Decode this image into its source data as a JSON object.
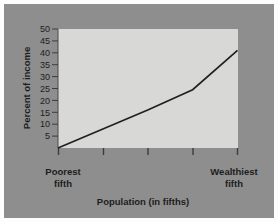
{
  "figure": {
    "background_color": "#8e8e8e",
    "plot_area_color": "#d8d8d6",
    "line_color": "#23211f",
    "text_color": "#1d1d1d"
  },
  "chart_data": {
    "type": "line",
    "title": "",
    "subtitle": "",
    "xlabel": "Population (in fifths)",
    "ylabel": "Percent of income",
    "grid": false,
    "legend": false,
    "legend_position": "none",
    "xlim": [
      1,
      5
    ],
    "ylim": [
      0,
      50
    ],
    "x_tick_count": 5,
    "x_tick_labels": [
      "",
      "",
      "",
      "",
      ""
    ],
    "x_category_labels": {
      "first": "Poorest fifth",
      "first_line1": "Poorest",
      "first_line2": "fifth",
      "last": "Wealthiest fifth",
      "last_line1": "Wealthiest",
      "last_line2": "fifth"
    },
    "y_ticks": [
      5,
      10,
      15,
      20,
      25,
      30,
      35,
      40,
      45,
      50
    ],
    "y_tick_labels": [
      "5",
      "10",
      "15",
      "20",
      "25",
      "30",
      "35",
      "40",
      "45",
      "50"
    ],
    "categories": [
      "1",
      "2",
      "3",
      "4",
      "5"
    ],
    "x": [
      1,
      2,
      3,
      4,
      5
    ],
    "values": [
      0,
      8,
      16,
      24.5,
      41
    ],
    "series": [
      {
        "name": "Percent of income",
        "values": [
          0,
          8,
          16,
          24.5,
          41
        ]
      }
    ]
  }
}
